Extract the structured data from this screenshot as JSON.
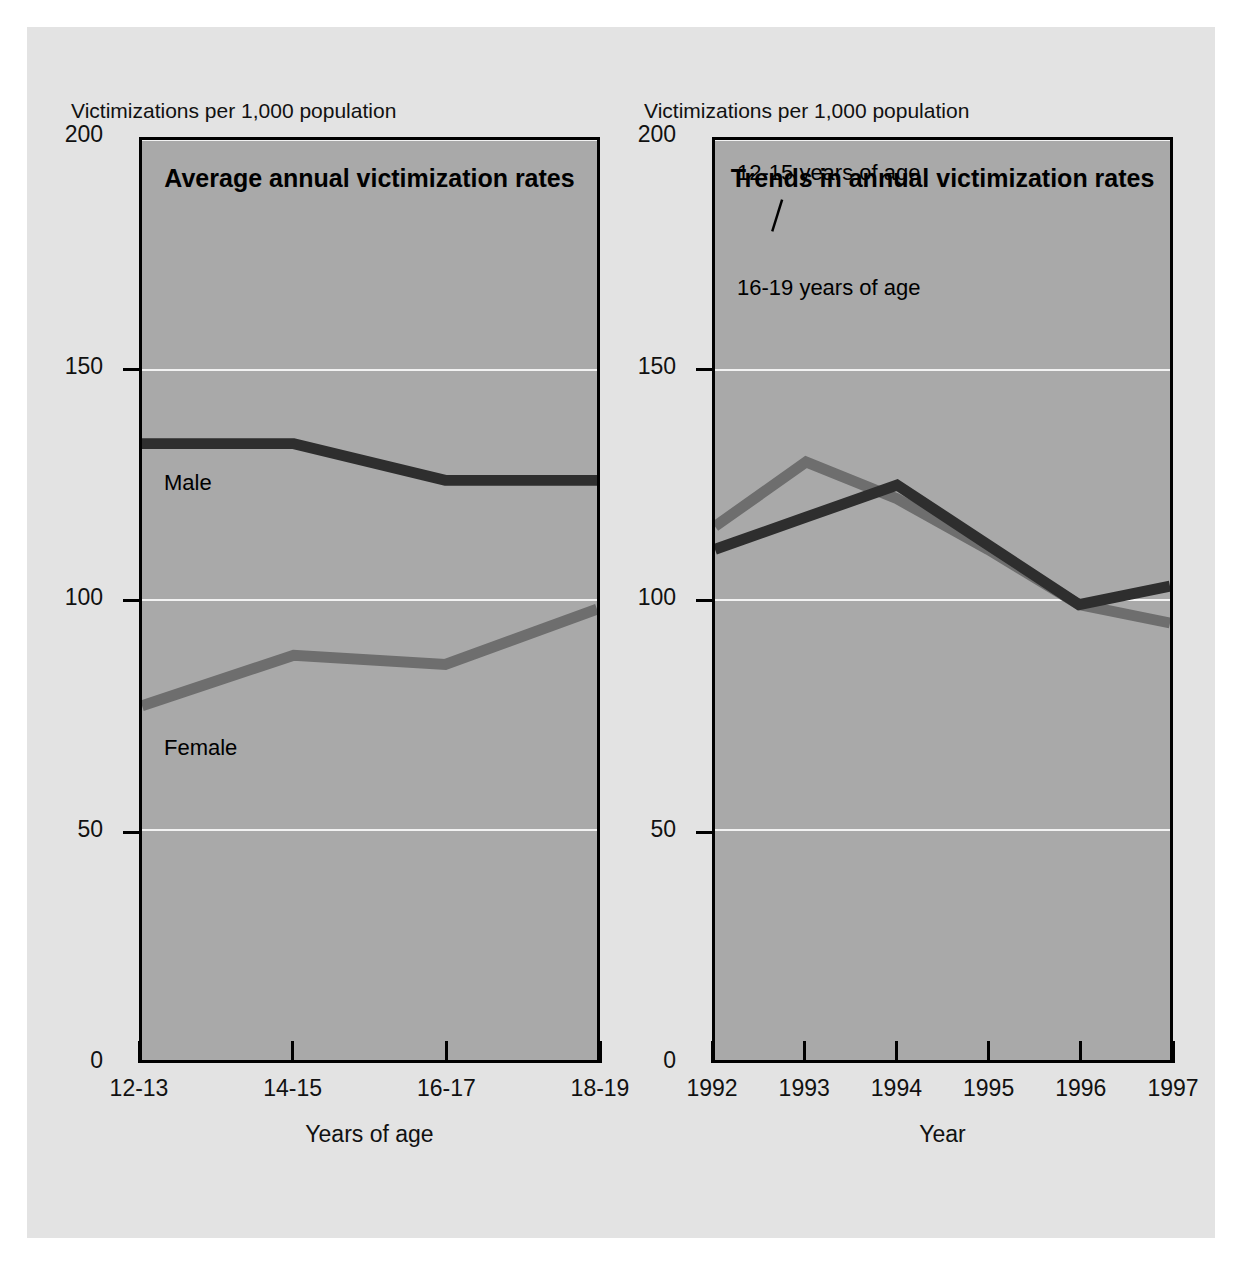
{
  "figure": {
    "y_axis_caption": "Victimizations per 1,000 population",
    "charts": [
      {
        "title": "Average annual victimization rates",
        "xlabel": "Years of age",
        "ylabel": "Victimizations per 1,000 population",
        "categories": [
          "12-13",
          "14-15",
          "16-17",
          "18-19"
        ],
        "yticks": [
          "0",
          "50",
          "100",
          "150",
          "200"
        ],
        "series": [
          {
            "name": "Male",
            "label": "Male",
            "color": "#2e2e2e",
            "values": [
              134,
              134,
              126,
              126
            ]
          },
          {
            "name": "Female",
            "label": "Female",
            "color": "#6e6e6e",
            "values": [
              77,
              88,
              86,
              98
            ]
          }
        ]
      },
      {
        "title": "Trends in annual victimization rates",
        "xlabel": "Year",
        "ylabel": "Victimizations per 1,000 population",
        "categories": [
          "1992",
          "1993",
          "1994",
          "1995",
          "1996",
          "1997"
        ],
        "yticks": [
          "0",
          "50",
          "100",
          "150",
          "200"
        ],
        "series": [
          {
            "name": "12-15 years of age",
            "label": "12-15 years of age",
            "color": "#6e6e6e",
            "values": [
              116,
              130,
              122,
              111,
              99,
              95
            ]
          },
          {
            "name": "16-19 years of age",
            "label": "16-19 years of age",
            "color": "#2e2e2e",
            "values": [
              111,
              118,
              125,
              112,
              99,
              103
            ]
          }
        ]
      }
    ]
  },
  "chart_data": [
    {
      "type": "line",
      "title": "Average annual victimization rates",
      "xlabel": "Years of age",
      "ylabel": "Victimizations per 1,000 population",
      "categories": [
        "12-13",
        "14-15",
        "16-17",
        "18-19"
      ],
      "ylim": [
        0,
        200
      ],
      "yticks": [
        0,
        50,
        100,
        150,
        200
      ],
      "grid": true,
      "legend": "inline-labels",
      "series": [
        {
          "name": "Male",
          "values": [
            134,
            134,
            126,
            126
          ]
        },
        {
          "name": "Female",
          "values": [
            77,
            88,
            86,
            98
          ]
        }
      ]
    },
    {
      "type": "line",
      "title": "Trends in annual victimization rates",
      "xlabel": "Year",
      "ylabel": "Victimizations per 1,000 population",
      "categories": [
        "1992",
        "1993",
        "1994",
        "1995",
        "1996",
        "1997"
      ],
      "ylim": [
        0,
        200
      ],
      "yticks": [
        0,
        50,
        100,
        150,
        200
      ],
      "grid": true,
      "legend": "inline-labels",
      "series": [
        {
          "name": "12-15 years of age",
          "values": [
            116,
            130,
            122,
            111,
            99,
            95
          ]
        },
        {
          "name": "16-19 years of age",
          "values": [
            111,
            118,
            125,
            112,
            99,
            103
          ]
        }
      ]
    }
  ]
}
